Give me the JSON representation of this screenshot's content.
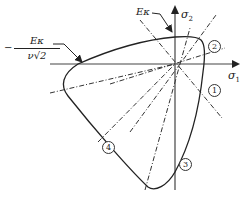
{
  "diagram": {
    "labels": {
      "sigma1": "σ",
      "sigma1_sub": "1",
      "sigma2": "σ",
      "sigma2_sub": "2",
      "top_annotation": "Eκ",
      "left_annotation_minus": "−",
      "left_annotation_num": "Eκ",
      "left_annotation_den": "ν√2"
    },
    "regions": [
      {
        "id": "1",
        "label": "①"
      },
      {
        "id": "2",
        "label": "②"
      },
      {
        "id": "3",
        "label": "③"
      },
      {
        "id": "4",
        "label": "④"
      }
    ],
    "colors": {
      "line": "#222222",
      "axis": "#444444",
      "background": "#ffffff"
    }
  }
}
